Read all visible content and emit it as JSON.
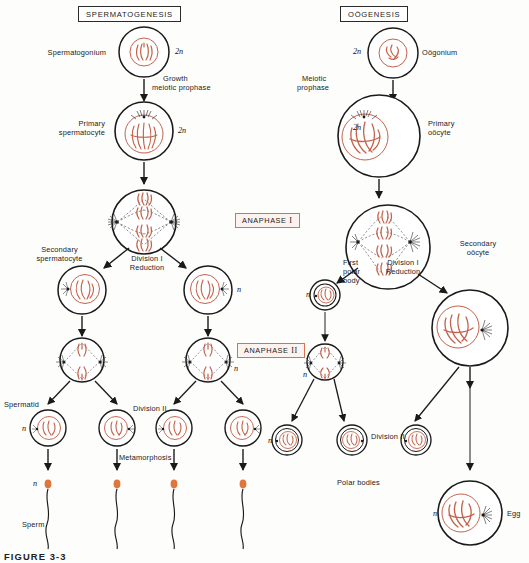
{
  "figure": {
    "caption": "FIGURE 3-3",
    "colors": {
      "chromosome": "#c4624a",
      "chromosome_light": "#d08a74",
      "sperm_head": "#e0763f",
      "outline": "#1a1a1a",
      "anaphase_box_border": "#d8714c",
      "header_box_border": "#2b2b2b",
      "background": "#fdfdfc"
    }
  },
  "headers": [
    {
      "label": "SPERMATOGENESIS"
    },
    {
      "label": "OÖGENESIS"
    }
  ],
  "stage_labels": [
    {
      "label": "ANAPHASE I",
      "roman": "I",
      "base": "ANAPHASE"
    },
    {
      "label": "ANAPHASE II",
      "roman": "II",
      "base": "ANAPHASE"
    }
  ],
  "spermatogenesis": {
    "cells": [
      {
        "name": "Spermatogonium",
        "ploidy": "2n"
      },
      {
        "name": "Primary spermatocyte",
        "ploidy": "2n"
      },
      {
        "name": "Secondary spermatocyte",
        "ploidy": "n"
      },
      {
        "name": "Spermatid",
        "ploidy": "n"
      },
      {
        "name": "Sperm",
        "ploidy": "n"
      }
    ],
    "transitions": [
      {
        "label": "Growth meiotic prophase",
        "line1": "Growth",
        "line2": "meiotic prophase"
      },
      {
        "label": "Division I Reduction",
        "line1": "Division I",
        "line2": "Reduction"
      },
      {
        "label": "Division II",
        "line1": "Division II",
        "line2": ""
      },
      {
        "label": "Metamorphosis",
        "line1": "Metamorphosis",
        "line2": ""
      }
    ]
  },
  "oogenesis": {
    "cells": [
      {
        "name": "Oögonium",
        "ploidy": "2n"
      },
      {
        "name": "Primary oöcyte",
        "ploidy": "2n"
      },
      {
        "name": "Secondary oöcyte",
        "ploidy": "n"
      },
      {
        "name": "First polar body",
        "ploidy": "n"
      },
      {
        "name": "Polar bodies",
        "ploidy": "n"
      },
      {
        "name": "Egg",
        "ploidy": "n"
      }
    ],
    "transitions": [
      {
        "label": "Meiotic prophase",
        "line1": "Meiotic",
        "line2": "prophase"
      },
      {
        "label": "Division I Reduction",
        "line1": "Division I",
        "line2": "Reduction"
      },
      {
        "label": "Division II",
        "line1": "Division II",
        "line2": ""
      }
    ]
  },
  "labels": {
    "spermatogonium": "Spermatogonium",
    "primary_spermatocyte_l1": "Primary",
    "primary_spermatocyte_l2": "spermatocyte",
    "secondary_spermatocyte_l1": "Secondary",
    "secondary_spermatocyte_l2": "spermatocyte",
    "spermatid": "Spermatid",
    "sperm": "Sperm",
    "growth_l1": "Growth",
    "growth_l2": "meiotic prophase",
    "division_i_l1": "Division I",
    "division_i_l2": "Reduction",
    "division_ii": "Division II",
    "metamorphosis": "Metamorphosis",
    "oogonium": "Oögonium",
    "primary_oocyte_l1": "Primary",
    "primary_oocyte_l2": "oöcyte",
    "secondary_oocyte_l1": "Secondary",
    "secondary_oocyte_l2": "oöcyte",
    "first_polar_l1": "First",
    "first_polar_l2": "polar",
    "first_polar_l3": "body",
    "polar_bodies": "Polar bodies",
    "egg": "Egg",
    "meiotic_l1": "Meiotic",
    "meiotic_l2": "prophase",
    "ploidy_2n": "2n",
    "ploidy_n": "n"
  }
}
